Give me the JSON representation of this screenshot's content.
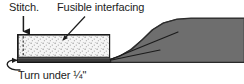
{
  "figure": {
    "width": 244,
    "height": 84,
    "background": "#ffffff"
  },
  "labels": {
    "stitch": "Stitch.",
    "fusible": "Fusible interfacing",
    "turn_under": "Turn under ¼\""
  },
  "colors": {
    "ink": "#1c1c1c",
    "fabric_dark": "#6e6e6e",
    "fabric_dark_edge": "#5a5a5a",
    "interfacing_fill": "#f4f4f4",
    "stipple_dot": "#9a9a9a",
    "fold_band": "#3a3a3a",
    "outline": "#222222",
    "paper": "#ffffff"
  },
  "annotations": [
    {
      "name": "stitch-arrow",
      "points_to": "stitch line at left edge of strip",
      "style": "straight-down-arrow"
    },
    {
      "name": "fusible-leader",
      "points_to": "stippled interfacing area",
      "style": "diagonal-leader-arrow"
    },
    {
      "name": "turn-under-hook",
      "points_to": "folded lower edge of fabric",
      "style": "curved-hook-arrow"
    }
  ],
  "geometry": {
    "strip": {
      "x": 17,
      "y": 34,
      "width": 93,
      "height": 24
    },
    "fold_band": {
      "x": 17,
      "y": 57,
      "width": 93,
      "height": 5
    },
    "stitch_line_x": 23,
    "garment_rise_x": 108
  }
}
